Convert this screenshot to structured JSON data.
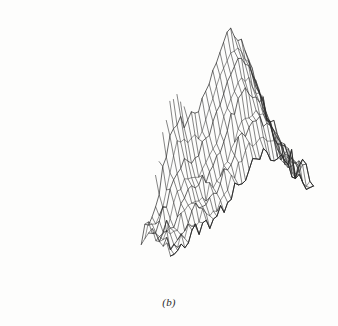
{
  "figure": {
    "caption": "(b)",
    "title": "",
    "kind": "3d-wireframe-surface-plot",
    "line_color": "#2b2b2b",
    "background_color": "#fdfdfc"
  },
  "chart_data": {
    "type": "surface",
    "title": "",
    "xlabel": "",
    "ylabel": "",
    "zlabel": "",
    "grid": true,
    "legend": null,
    "axis_shown": false,
    "tick_labels": [],
    "annotations": [
      "(b)"
    ],
    "projection": {
      "type": "oblique-isometric-wireframe",
      "elevation_deg": 28,
      "azimuth_deg": 38,
      "hidden_line_removal": false
    },
    "grid_size": {
      "nx": 40,
      "ny": 40
    },
    "x": [
      0.0,
      1.0
    ],
    "y": [
      0.0,
      1.0
    ],
    "zlim": [
      0.0,
      1.0
    ],
    "peaks": [
      {
        "name": "main-dome",
        "cx": 0.64,
        "cy": 0.3,
        "height": 1.0,
        "sigma_x": 0.17,
        "sigma_y": 0.2
      },
      {
        "name": "secondary-ridge",
        "cx": 0.22,
        "cy": 0.42,
        "height": 0.62,
        "sigma_x": 0.1,
        "sigma_y": 0.16
      },
      {
        "name": "shoulder-bump",
        "cx": 0.34,
        "cy": 0.3,
        "height": 0.34,
        "sigma_x": 0.1,
        "sigma_y": 0.09
      },
      {
        "name": "mid-saddle",
        "cx": 0.45,
        "cy": 0.52,
        "height": 0.3,
        "sigma_x": 0.22,
        "sigma_y": 0.18
      },
      {
        "name": "front-lobe",
        "cx": 0.58,
        "cy": 0.72,
        "height": 0.18,
        "sigma_x": 0.18,
        "sigma_y": 0.14
      }
    ],
    "noise": {
      "amplitude": 0.045,
      "seed": 20240117
    },
    "baseline": 0.04
  }
}
